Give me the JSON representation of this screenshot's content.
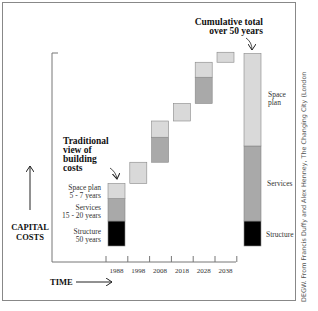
{
  "chart_data": {
    "type": "bar",
    "subtype": "waterfall-stacked",
    "title": "",
    "xlabel": "TIME",
    "ylabel": "CAPITAL COSTS",
    "categories": [
      "1988",
      "1998",
      "2008",
      "2018",
      "2028",
      "2038"
    ],
    "tick_labels": [
      "1988",
      "1998",
      "2008",
      "2018",
      "2028",
      "2038"
    ],
    "units": "relative capital cost (structure = 1)",
    "series": [
      {
        "name": "Structure",
        "color": "#000000",
        "values": [
          1.0,
          0,
          0,
          0,
          0,
          0
        ]
      },
      {
        "name": "Services",
        "color": "#a9a9a9",
        "values": [
          0.9,
          0,
          1.0,
          0,
          1.05,
          0
        ]
      },
      {
        "name": "Space plan",
        "color": "#d9d9d9",
        "values": [
          0.6,
          0.85,
          0.65,
          0.7,
          0.6,
          0.4
        ]
      }
    ],
    "cumulative": {
      "label": "Cumulative total over 50 years",
      "segments": [
        {
          "name": "Structure",
          "value": 1.0,
          "label": "Structure"
        },
        {
          "name": "Services",
          "value": 3.0,
          "label": "Services"
        },
        {
          "name": "Space plan",
          "value": 3.7,
          "label": "Space plan"
        }
      ]
    },
    "ylim": [
      0,
      7.8
    ],
    "grid": false,
    "annotations": {
      "traditional_view": [
        "Traditional",
        "view of",
        "building",
        "costs"
      ],
      "cumulative_title": [
        "Cumulative total",
        "over 50 years"
      ],
      "left_legend": [
        {
          "lines": [
            "Space plan",
            "5 - 7 years"
          ]
        },
        {
          "lines": [
            "Services",
            "15 - 20 years"
          ]
        },
        {
          "lines": [
            "Structure",
            "50 years"
          ]
        }
      ]
    }
  },
  "axis": {
    "y_label_lines": [
      "CAPITAL",
      "COSTS"
    ],
    "x_label": "TIME"
  },
  "credit": "DEGW. From Francis Duffy and Alex Henney, The Changing City (London"
}
